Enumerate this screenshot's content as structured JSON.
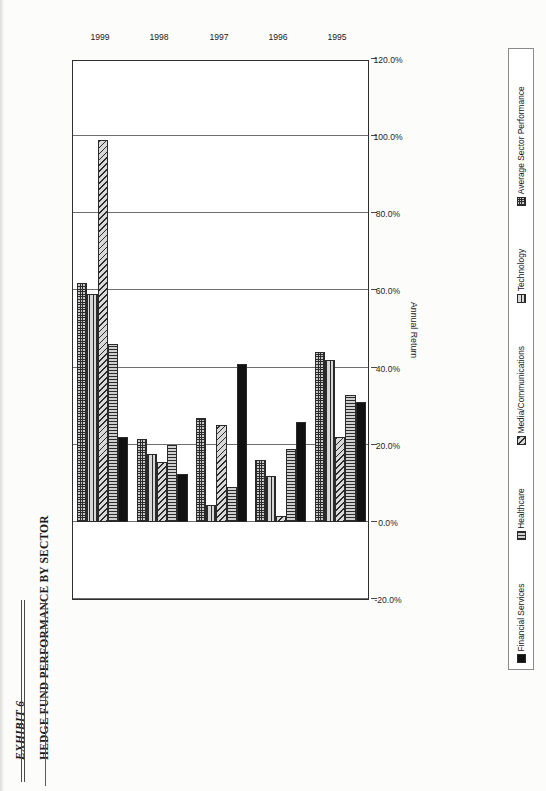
{
  "document": {
    "exhibit_label": "EXHIBIT 6",
    "title": "HEDGE FUND PERFORMANCE BY SECTOR"
  },
  "chart_data": {
    "type": "bar",
    "orientation": "horizontal",
    "title": "HEDGE FUND PERFORMANCE BY SECTOR",
    "xlabel": "Annual Return",
    "ylabel": "",
    "categories": [
      "1995",
      "1996",
      "1997",
      "1998",
      "1999"
    ],
    "tick_labels": [
      "120.0%",
      "100.0%",
      "80.0%",
      "60.0%",
      "40.0%",
      "20.0%",
      "0.0%",
      "-20.0%"
    ],
    "tick_values": [
      120,
      100,
      80,
      60,
      40,
      20,
      0,
      -20
    ],
    "xlim": [
      -20,
      120
    ],
    "grid": true,
    "legend_position": "bottom",
    "series": [
      {
        "name": "Financial Services",
        "pattern": "solid",
        "values": [
          31.0,
          26.0,
          41.0,
          12.5,
          22.0
        ]
      },
      {
        "name": "Healthcare",
        "pattern": "vertical",
        "values": [
          33.0,
          19.0,
          9.0,
          20.0,
          46.0
        ]
      },
      {
        "name": "Media/Communications",
        "pattern": "diagonal",
        "values": [
          22.0,
          1.5,
          25.0,
          15.5,
          99.0
        ]
      },
      {
        "name": "Technology",
        "pattern": "horizontal",
        "values": [
          42.0,
          12.0,
          4.5,
          17.5,
          59.0
        ]
      },
      {
        "name": "Average Sector Performance",
        "pattern": "crosshatch",
        "values": [
          44.0,
          16.0,
          27.0,
          21.5,
          62.0
        ]
      }
    ]
  }
}
